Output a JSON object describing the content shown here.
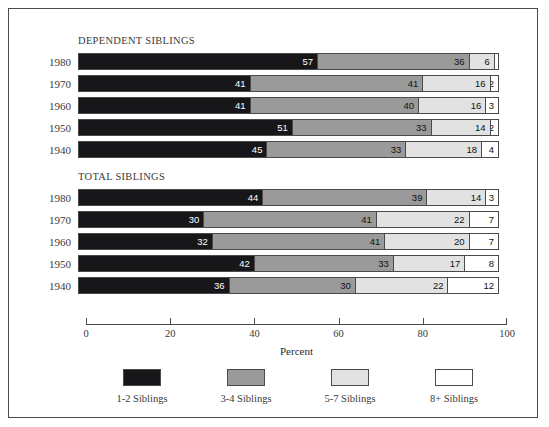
{
  "chart_data": {
    "type": "bar",
    "subtype": "stacked-horizontal-percent",
    "title": "",
    "xlabel": "Percent",
    "ylabel": "",
    "xlim": [
      0,
      100
    ],
    "grid": false,
    "legend_position": "bottom",
    "legend": [
      "1-2 Siblings",
      "3-4 Siblings",
      "5-7 Siblings",
      "8+ Siblings"
    ],
    "colors": [
      "#17171a",
      "#9a9a9a",
      "#e2e2e2",
      "#ffffff"
    ],
    "xticks": [
      0,
      20,
      40,
      60,
      80,
      100
    ],
    "xticklabels": [
      "0",
      "20",
      "40",
      "60",
      "80",
      "100"
    ],
    "panels": [
      {
        "title": "DEPENDENT SIBLINGS",
        "categories": [
          "1980",
          "1970",
          "1960",
          "1950",
          "1940"
        ],
        "series": [
          {
            "name": "1-2 Siblings",
            "values": [
              57,
              41,
              41,
              51,
              45
            ]
          },
          {
            "name": "3-4 Siblings",
            "values": [
              36,
              41,
              40,
              33,
              33
            ]
          },
          {
            "name": "5-7 Siblings",
            "values": [
              6,
              16,
              16,
              14,
              18
            ]
          },
          {
            "name": "8+ Siblings",
            "values": [
              1,
              2,
              3,
              2,
              4
            ]
          }
        ]
      },
      {
        "title": "TOTAL SIBLINGS",
        "categories": [
          "1980",
          "1970",
          "1960",
          "1950",
          "1940"
        ],
        "series": [
          {
            "name": "1-2 Siblings",
            "values": [
              44,
              30,
              32,
              42,
              36
            ]
          },
          {
            "name": "3-4 Siblings",
            "values": [
              39,
              41,
              41,
              33,
              30
            ]
          },
          {
            "name": "5-7 Siblings",
            "values": [
              14,
              22,
              20,
              17,
              22
            ]
          },
          {
            "name": "8+ Siblings",
            "values": [
              3,
              7,
              7,
              8,
              12
            ]
          }
        ]
      }
    ]
  }
}
